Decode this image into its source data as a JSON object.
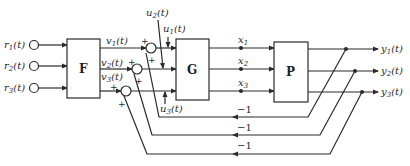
{
  "diagram": {
    "type": "block-diagram",
    "blocks": [
      {
        "id": "F",
        "label": "F"
      },
      {
        "id": "G",
        "label": "G"
      },
      {
        "id": "P",
        "label": "P"
      }
    ],
    "inputs": [
      {
        "name": "r",
        "sub": "1",
        "arg": "(t)"
      },
      {
        "name": "r",
        "sub": "2",
        "arg": "(t)"
      },
      {
        "name": "r",
        "sub": "3",
        "arg": "(t)"
      }
    ],
    "f_outputs": [
      {
        "name": "v",
        "sub": "1",
        "arg": "(t)"
      },
      {
        "name": "v",
        "sub": "2",
        "arg": "(t)"
      },
      {
        "name": "v",
        "sub": "3",
        "arg": "(t)"
      }
    ],
    "disturbances": [
      {
        "name": "u",
        "sub": "1",
        "arg": "(t)"
      },
      {
        "name": "u",
        "sub": "2",
        "arg": "(t)"
      },
      {
        "name": "u",
        "sub": "3",
        "arg": "(t)"
      }
    ],
    "states": [
      {
        "name": "x",
        "sub": "1"
      },
      {
        "name": "x",
        "sub": "2"
      },
      {
        "name": "x",
        "sub": "3"
      }
    ],
    "outputs": [
      {
        "name": "y",
        "sub": "1",
        "arg": "(t)"
      },
      {
        "name": "y",
        "sub": "2",
        "arg": "(t)"
      },
      {
        "name": "y",
        "sub": "3",
        "arg": "(t)"
      }
    ],
    "summing_signs": {
      "plus": "+"
    },
    "feedback_gains": [
      "−1",
      "−1",
      "−1"
    ]
  }
}
